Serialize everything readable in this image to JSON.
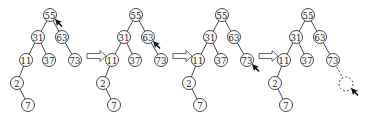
{
  "diagram": {
    "type": "binary-search-tree-insertion-steps",
    "caption": "",
    "node_radius": 6.5,
    "tree_template": {
      "nodes": [
        {
          "id": "n55",
          "label": "55",
          "x": 50,
          "y": 15
        },
        {
          "id": "n31",
          "label": "31",
          "x": 38,
          "y": 37
        },
        {
          "id": "n63",
          "label": "63",
          "x": 62,
          "y": 37
        },
        {
          "id": "n11",
          "label": "11",
          "x": 26,
          "y": 60
        },
        {
          "id": "n37",
          "label": "37",
          "x": 49,
          "y": 60
        },
        {
          "id": "n73",
          "label": "73",
          "x": 75,
          "y": 60
        },
        {
          "id": "n2",
          "label": "2",
          "x": 17,
          "y": 83
        },
        {
          "id": "n7",
          "label": "7",
          "x": 28,
          "y": 105
        }
      ],
      "edges": [
        [
          "n55",
          "n31"
        ],
        [
          "n55",
          "n63"
        ],
        [
          "n31",
          "n11"
        ],
        [
          "n31",
          "n37"
        ],
        [
          "n63",
          "n73"
        ],
        [
          "n11",
          "n2"
        ],
        [
          "n2",
          "n7"
        ]
      ]
    },
    "steps": [
      {
        "offset_x": 0,
        "pointer_at": "n55",
        "pointer_dx": 6,
        "pointer_dy": 6
      },
      {
        "offset_x": 86,
        "pointer_at": "n63",
        "pointer_dx": 6,
        "pointer_dy": 6
      },
      {
        "offset_x": 172,
        "pointer_at": "n73",
        "pointer_dx": 6,
        "pointer_dy": 6
      },
      {
        "offset_x": 258,
        "pointer_at": "new",
        "pointer_dx": 6,
        "pointer_dy": 6,
        "new_node": {
          "x": 88,
          "y": 84,
          "label": "",
          "dashed": true,
          "parent": "n73"
        }
      }
    ],
    "arrows": [
      {
        "x": 87,
        "y": 56
      },
      {
        "x": 173,
        "y": 56
      },
      {
        "x": 259,
        "y": 56
      }
    ]
  }
}
